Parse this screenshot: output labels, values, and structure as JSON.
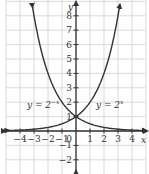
{
  "chart_data": {
    "type": "line",
    "title": "",
    "xlabel": "x",
    "ylabel": "y",
    "xlim": [
      -5,
      5
    ],
    "ylim": [
      -3,
      9
    ],
    "grid": true,
    "x_ticks": [
      -4,
      -3,
      -2,
      -1,
      1,
      2,
      3,
      4
    ],
    "x_tick_labels": [
      "−4",
      "−3",
      "−2",
      "−1",
      "1",
      "2",
      "3",
      "4"
    ],
    "y_ticks": [
      -2,
      -1,
      1,
      2,
      3,
      4,
      5,
      6,
      7,
      8
    ],
    "y_tick_labels": [
      "−2",
      "−1",
      "1",
      "2",
      "3",
      "4",
      "5",
      "6",
      "7",
      "8"
    ],
    "origin_label": "0",
    "series": [
      {
        "name": "y = 2^-x",
        "label_text": "y = 2",
        "label_exp": "−x",
        "x": [
          -3.1,
          -3,
          -2,
          -1,
          0,
          1,
          2,
          3,
          4,
          4.8
        ],
        "values": [
          8.57,
          8,
          4,
          2,
          1,
          0.5,
          0.25,
          0.125,
          0.0625,
          0.036
        ]
      },
      {
        "name": "y = 2^x",
        "label_text": "y = 2",
        "label_exp": "x",
        "x": [
          -4.8,
          -4,
          -3,
          -2,
          -1,
          0,
          1,
          2,
          3,
          3.1
        ],
        "values": [
          0.036,
          0.0625,
          0.125,
          0.25,
          0.5,
          1,
          2,
          4,
          8,
          8.57
        ]
      }
    ],
    "colors": {
      "curve": "#333333",
      "axis": "#333333",
      "grid": "#cfcfcf",
      "text": "#333333"
    }
  }
}
